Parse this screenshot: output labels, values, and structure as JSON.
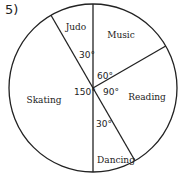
{
  "problem_number": "5)",
  "chart_data": {
    "type": "pie",
    "title": "",
    "categories": [
      "Music",
      "Reading",
      "Dancing",
      "Skating",
      "Judo"
    ],
    "values": [
      60,
      90,
      30,
      150,
      30
    ],
    "unit": "degrees",
    "angle_labels": [
      "60°",
      "90°",
      "30°",
      "150°",
      "30°"
    ],
    "legend": "none",
    "start_angle": 0,
    "direction": "clockwise"
  },
  "colors": {
    "stroke": "#222222",
    "fill": "#ffffff"
  }
}
